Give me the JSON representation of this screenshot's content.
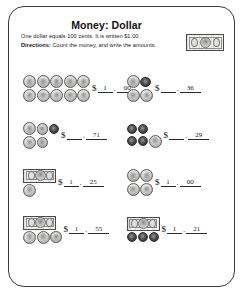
{
  "worksheet": {
    "title": "Money: Dollar",
    "subtitle": "One dollar equals 100 cents. It is written $1.00.",
    "directions_label": "Directions:",
    "directions_text": "Count the money, and write the amounts.",
    "currency_symbol": "$",
    "decimal_point": "."
  },
  "problems": [
    {
      "id": 1,
      "money": {
        "bills": 0,
        "coin_rows": [
          [
            "quarter",
            "quarter",
            "quarter",
            "quarter",
            "quarter"
          ],
          [
            "quarter",
            "quarter",
            "quarter",
            "quarter",
            "quarter"
          ]
        ]
      },
      "answer_dollars": "1",
      "answer_cents": "00"
    },
    {
      "id": 2,
      "money": {
        "bills": 0,
        "coin_rows": [
          [
            "quarter",
            "penny"
          ],
          [
            "quarter",
            "quarter"
          ]
        ]
      },
      "answer_dollars": "",
      "answer_cents": "36"
    },
    {
      "id": 3,
      "money": {
        "bills": 0,
        "coin_rows": [
          [
            "quarter",
            "nickel",
            "penny"
          ],
          [
            "quarter",
            "nickel"
          ]
        ]
      },
      "answer_dollars": "",
      "answer_cents": "71"
    },
    {
      "id": 4,
      "money": {
        "bills": 0,
        "coin_rows": [
          [
            "penny",
            "penny"
          ],
          [
            "penny",
            "penny",
            "quarter"
          ]
        ]
      },
      "answer_dollars": "",
      "answer_cents": "29"
    },
    {
      "id": 5,
      "money": {
        "bills": 1,
        "coin_rows": [
          [
            "quarter"
          ]
        ]
      },
      "answer_dollars": "1",
      "answer_cents": "25"
    },
    {
      "id": 6,
      "money": {
        "bills": 0,
        "coin_rows": [
          [
            "quarter",
            "quarter"
          ],
          [
            "quarter",
            "quarter"
          ]
        ]
      },
      "answer_dollars": "1",
      "answer_cents": "00"
    },
    {
      "id": 7,
      "money": {
        "bills": 1,
        "coin_rows": [
          [
            "quarter",
            "quarter",
            "nickel"
          ]
        ]
      },
      "answer_dollars": "1",
      "answer_cents": "55"
    },
    {
      "id": 8,
      "money": {
        "bills": 1,
        "coin_rows": [
          [
            "penny",
            "penny",
            "penny"
          ]
        ]
      },
      "answer_dollars": "1",
      "answer_cents": "21"
    }
  ]
}
